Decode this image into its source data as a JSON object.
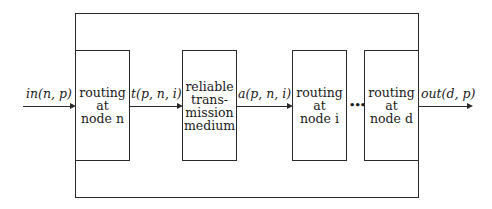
{
  "diagram": {
    "input_label": "in(n, p)",
    "output_label": "out(d, p)",
    "edge_labels": [
      "t(p, n, i)",
      "a(p, n, i)"
    ],
    "ellipsis": "•••",
    "nodes": [
      {
        "lines": [
          "routing",
          "at",
          "node n"
        ]
      },
      {
        "lines": [
          "reliable",
          "trans-",
          "mission",
          "medium"
        ]
      },
      {
        "lines": [
          "routing",
          "at",
          "node i"
        ]
      },
      {
        "lines": [
          "routing",
          "at",
          "node d"
        ]
      }
    ]
  }
}
